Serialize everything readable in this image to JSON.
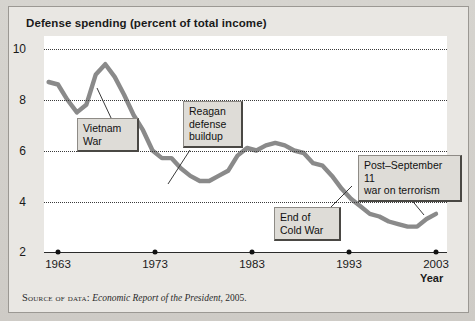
{
  "figure": {
    "title": "Defense spending (percent of total income)",
    "source_prefix": "Source of data:",
    "source_italic": "Economic Report of the President",
    "source_suffix": ", 2005.",
    "xaxis_title": "Year",
    "line_color": "#8a8a8a",
    "grid_color": "#3a3a3a",
    "panel_color": "#e9e7e3",
    "plot_bg": "#ffffff",
    "callout_bg": "#dedcd7"
  },
  "annotations": [
    {
      "id": "vietnam-war",
      "text": "Vietnam\nWar"
    },
    {
      "id": "reagan-buildup",
      "text": "Reagan\ndefense\nbuildup"
    },
    {
      "id": "end-of-cold-war",
      "text": "End of\nCold War"
    },
    {
      "id": "war-on-terrorism",
      "text": "Post–September 11\nwar on terrorism"
    }
  ],
  "chart_data": {
    "type": "line",
    "title": "Defense spending (percent of total income)",
    "xlabel": "Year",
    "ylabel": "",
    "xlim": [
      1962,
      2004
    ],
    "ylim": [
      2,
      10
    ],
    "yticks": [
      2,
      4,
      6,
      8,
      10
    ],
    "xticks": [
      1963,
      1973,
      1983,
      1993,
      2003
    ],
    "ytick_labels": [
      "2",
      "4",
      "6",
      "8",
      "10"
    ],
    "xtick_labels": [
      "1963",
      "1973",
      "1983",
      "1993",
      "2003"
    ],
    "grid": "horizontal-dotted",
    "legend": "none",
    "series": [
      {
        "name": "Defense spending (percent of total income)",
        "x": [
          1962,
          1963,
          1964,
          1965,
          1966,
          1967,
          1968,
          1969,
          1970,
          1971,
          1972,
          1973,
          1974,
          1975,
          1976,
          1977,
          1978,
          1979,
          1980,
          1981,
          1982,
          1983,
          1984,
          1985,
          1986,
          1987,
          1988,
          1989,
          1990,
          1991,
          1992,
          1993,
          1994,
          1995,
          1996,
          1997,
          1998,
          1999,
          2000,
          2001,
          2002,
          2003
        ],
        "values": [
          8.7,
          8.6,
          8.0,
          7.5,
          7.8,
          9.0,
          9.4,
          8.9,
          8.2,
          7.4,
          6.8,
          6.0,
          5.7,
          5.7,
          5.3,
          5.0,
          4.8,
          4.8,
          5.0,
          5.2,
          5.8,
          6.1,
          6.0,
          6.2,
          6.3,
          6.2,
          6.0,
          5.9,
          5.5,
          5.4,
          5.0,
          4.5,
          4.1,
          3.8,
          3.5,
          3.4,
          3.2,
          3.1,
          3.0,
          3.0,
          3.3,
          3.5
        ]
      }
    ],
    "annotations": [
      {
        "label": "Vietnam War",
        "x": 1967,
        "y": 9.2
      },
      {
        "label": "Reagan defense buildup",
        "x": 1981,
        "y": 5.2
      },
      {
        "label": "End of Cold War",
        "x": 1992,
        "y": 4.9
      },
      {
        "label": "Post–September 11 war on terrorism",
        "x": 2002,
        "y": 3.3
      }
    ]
  }
}
